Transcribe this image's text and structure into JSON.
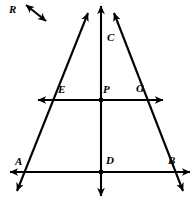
{
  "figure": {
    "type": "geometry-diagram",
    "background_color": "#ffffff",
    "stroke_color": "#000000"
  },
  "labels": {
    "R": "R",
    "C": "C",
    "E": "E",
    "P": "P",
    "G": "G",
    "A": "A",
    "D": "D",
    "B": "B"
  },
  "points": {
    "C": {
      "label": "C",
      "x": 101,
      "y": 42
    },
    "E": {
      "label": "E",
      "x": 68,
      "y": 100
    },
    "P": {
      "label": "P",
      "x": 101,
      "y": 100
    },
    "G": {
      "label": "G",
      "x": 134,
      "y": 100
    },
    "A": {
      "label": "A",
      "x": 27,
      "y": 172
    },
    "D": {
      "label": "D",
      "x": 101,
      "y": 172
    },
    "B": {
      "label": "B",
      "x": 173,
      "y": 172
    }
  },
  "lines": {
    "line_AB": {
      "name": "line-AB",
      "x1": 10,
      "y1": 172,
      "x2": 190,
      "y2": 172,
      "arrows": "both"
    },
    "line_EG": {
      "name": "line-EG",
      "x1": 38,
      "y1": 100,
      "x2": 163,
      "y2": 100,
      "arrows": "both"
    },
    "line_CD": {
      "name": "line-CD",
      "x1": 101,
      "y1": 6,
      "x2": 101,
      "y2": 196,
      "arrows": "both"
    },
    "line_AC": {
      "name": "line-AC",
      "x1": 17,
      "y1": 191,
      "x2": 88,
      "y2": 13,
      "arrows": "both"
    },
    "line_BC": {
      "name": "line-BC",
      "x1": 183,
      "y1": 191,
      "x2": 114,
      "y2": 13,
      "arrows": "both"
    },
    "line_R": {
      "name": "line-R-pointer",
      "x1": 26,
      "y1": 5,
      "x2": 46,
      "y2": 21,
      "arrows": "both"
    }
  },
  "vertex_dots": [
    {
      "name": "dot-P",
      "x": 101,
      "y": 100
    },
    {
      "name": "dot-D",
      "x": 101,
      "y": 172
    }
  ]
}
